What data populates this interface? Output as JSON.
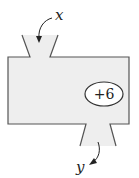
{
  "diagram": {
    "type": "function-machine",
    "input_label": "x",
    "output_label": "y",
    "operation": "+6",
    "colors": {
      "body_fill": "#eeeeee",
      "stroke": "#555555",
      "ellipse_fill": "#ffffff",
      "text": "#222222"
    }
  }
}
